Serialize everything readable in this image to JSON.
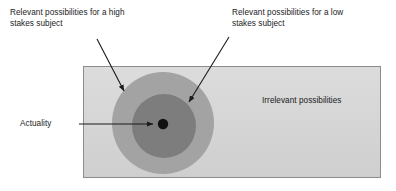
{
  "figure": {
    "background_color": "#ffffff"
  },
  "labels": {
    "high_stakes": "Relevant possibilities for a high\nstakes subject",
    "low_stakes": "Relevant possibilities for a low\nstakes subject",
    "irrelevant": "Irrelevant possibilities",
    "actuality": "Actuality"
  },
  "shapes": {
    "outer_rectangle": {
      "name": "Irrelevant possibilities region",
      "fill": "#d4d4d4",
      "stroke": "#8c8c8c",
      "x": 83,
      "y": 66,
      "width": 298,
      "height": 112
    },
    "outer_circle": {
      "name": "Relevant possibilities for a high stakes subject",
      "fill": "#a3a3a3",
      "cx": 163,
      "cy": 123,
      "r": 51
    },
    "inner_circle": {
      "name": "Relevant possibilities for a low stakes subject",
      "fill": "#7d7d7d",
      "cx": 164,
      "cy": 126,
      "r": 32
    },
    "actuality_dot": {
      "name": "Actuality point",
      "fill": "#111111",
      "cx": 163,
      "cy": 124,
      "r": 5.2
    }
  },
  "arrows": {
    "high_stakes_arrow": {
      "from_x": 97,
      "from_y": 39,
      "to_x": 125,
      "to_y": 93,
      "color": "#1a1a1a"
    },
    "low_stakes_arrow": {
      "from_x": 229,
      "from_y": 37,
      "to_x": 188,
      "to_y": 104,
      "color": "#1a1a1a"
    },
    "actuality_arrow": {
      "from_x": 79,
      "from_y": 124,
      "to_x": 155,
      "to_y": 124,
      "color": "#1a1a1a"
    }
  },
  "colors": {
    "rect_fill": "#d4d4d4",
    "rect_stroke": "#8c8c8c",
    "outer_circle_fill": "#a3a3a3",
    "inner_circle_fill": "#7d7d7d",
    "dot_fill": "#111111",
    "text": "#1a1a1a"
  }
}
